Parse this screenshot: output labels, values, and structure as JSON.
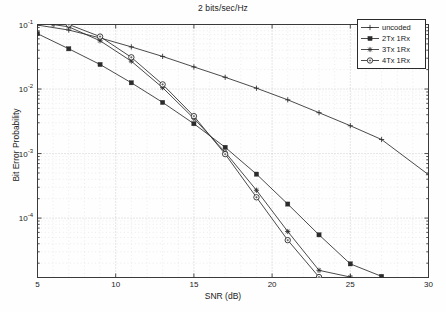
{
  "chart_data": {
    "type": "line",
    "title": "2 bits/sec/Hz",
    "xlabel": "SNR (dB)",
    "ylabel": "Bit Error Probability",
    "xlim": [
      5,
      30
    ],
    "ylim": [
      1.2e-05,
      0.1
    ],
    "yscale": "log",
    "xscale": "linear",
    "grid": true,
    "legend_position": "top-right",
    "xticks": [
      "5",
      "10",
      "15",
      "20",
      "25",
      "30"
    ],
    "xtick_values": [
      5,
      10,
      15,
      20,
      25,
      30
    ],
    "ytick_values": [
      0.1,
      0.01,
      0.001,
      0.0001
    ],
    "yticks": [
      {
        "mantissa": "10",
        "exp": "-1"
      },
      {
        "mantissa": "10",
        "exp": "-2"
      },
      {
        "mantissa": "10",
        "exp": "-3"
      },
      {
        "mantissa": "10",
        "exp": "-4"
      }
    ],
    "series": [
      {
        "name": "uncoded",
        "marker": "plus",
        "color": "#2b2b2b",
        "x": [
          5,
          7,
          9,
          11,
          13,
          15,
          17,
          19,
          21,
          23,
          25,
          27,
          30
        ],
        "y": [
          0.098,
          0.082,
          0.062,
          0.045,
          0.032,
          0.022,
          0.0152,
          0.0103,
          0.0068,
          0.0043,
          0.0027,
          0.00165,
          0.00047
        ]
      },
      {
        "name": "2Tx 1Rx",
        "marker": "star-filled",
        "color": "#2b2b2b",
        "x": [
          5,
          7,
          9,
          11,
          13,
          15,
          17,
          19,
          21,
          23,
          25,
          27
        ],
        "y": [
          0.072,
          0.042,
          0.024,
          0.0125,
          0.0062,
          0.0029,
          0.00125,
          0.00048,
          0.000165,
          5.5e-05,
          1.95e-05,
          1.25e-05
        ]
      },
      {
        "name": "3Tx 1Rx",
        "marker": "asterisk",
        "color": "#2b2b2b",
        "x": [
          6,
          7,
          9,
          11,
          13,
          15,
          17,
          19,
          21,
          23,
          25
        ],
        "y": [
          0.1,
          0.092,
          0.056,
          0.027,
          0.0105,
          0.0035,
          0.00105,
          0.00027,
          6.2e-05,
          1.55e-05,
          1.22e-05
        ]
      },
      {
        "name": "4Tx 1Rx",
        "marker": "circle",
        "color": "#2b2b2b",
        "x": [
          7,
          9,
          11,
          13,
          15,
          17,
          19,
          21,
          23
        ],
        "y": [
          0.1,
          0.065,
          0.031,
          0.0118,
          0.0038,
          0.00098,
          0.00021,
          4.55e-05,
          1.22e-05
        ]
      }
    ]
  },
  "legend": {
    "items": [
      {
        "label": "uncoded"
      },
      {
        "label": "2Tx 1Rx"
      },
      {
        "label": "3Tx 1Rx"
      },
      {
        "label": "4Tx 1Rx"
      }
    ]
  }
}
